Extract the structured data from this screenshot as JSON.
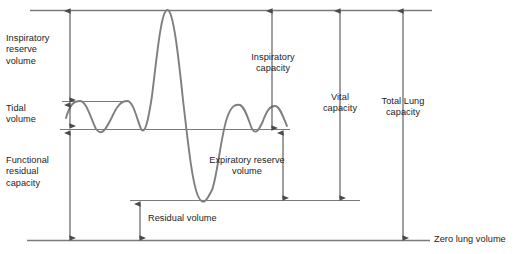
{
  "figure": {
    "stroke_color": "#7b7b7b",
    "arrow_color": "#4a4a4a",
    "text_color": "#1c1c1c",
    "background": "#ffffff"
  },
  "labels": {
    "inspiratory_reserve_volume": "Inspiratory\nreserve\nvolume",
    "tidal_volume": "Tidal\nvolume",
    "functional_residual_capacity": "Functional\nresidual\ncapacity",
    "residual_volume": "Residual volume",
    "expiratory_reserve_volume": "Expiratory reserve\nvolume",
    "inspiratory_capacity": "Inspiratory\ncapacity",
    "vital_capacity": "Vital\ncapacity",
    "total_lung_capacity": "Total Lung\ncapacity",
    "zero_lung_volume": "Zero lung volume"
  },
  "chart_data": {
    "type": "line",
    "xlabel": "",
    "ylabel": "Lung volume",
    "grid": false,
    "legend": null,
    "reference_levels": [
      {
        "name": "maximum-inspiration-level",
        "label": "Maximal inspiratory level",
        "y_px": 10,
        "x_start_px": 30,
        "x_end_px": 432
      },
      {
        "name": "tidal-peak-level",
        "label": "Tidal inspiratory level",
        "y_px": 101,
        "x_start_px": 62,
        "x_end_px": 130
      },
      {
        "name": "end-expiratory-level",
        "label": "End-expiratory (FRC) level",
        "y_px": 129,
        "x_start_px": 60,
        "x_end_px": 290
      },
      {
        "name": "residual-volume-level",
        "label": "Maximal expiratory level",
        "y_px": 200,
        "x_start_px": 130,
        "x_end_px": 360
      },
      {
        "name": "zero-lung-volume-level",
        "label": "Zero lung volume",
        "y_px": 240,
        "x_start_px": 27,
        "x_end_px": 430
      }
    ],
    "measures": [
      {
        "name": "inspiratory-reserve-volume",
        "label": "Inspiratory reserve volume",
        "from_level": "tidal-peak-level",
        "to_level": "maximum-inspiration-level",
        "arrow_x_px": 70,
        "y_top_px": 10,
        "y_bottom_px": 100,
        "double_headed": true
      },
      {
        "name": "tidal-volume",
        "label": "Tidal volume",
        "from_level": "end-expiratory-level",
        "to_level": "tidal-peak-level",
        "arrow_x_px": 70,
        "y_top_px": 104,
        "y_bottom_px": 126,
        "double_headed": true
      },
      {
        "name": "functional-residual-capacity",
        "label": "Functional residual capacity",
        "from_level": "zero-lung-volume-level",
        "to_level": "end-expiratory-level",
        "arrow_x_px": 70,
        "y_top_px": 132,
        "y_bottom_px": 238,
        "double_headed": true
      },
      {
        "name": "residual-volume",
        "label": "Residual volume",
        "from_level": "zero-lung-volume-level",
        "to_level": "residual-volume-level",
        "arrow_x_px": 140,
        "y_top_px": 203,
        "y_bottom_px": 238,
        "double_headed": true
      },
      {
        "name": "expiratory-reserve-volume",
        "label": "Expiratory reserve volume",
        "from_level": "residual-volume-level",
        "to_level": "end-expiratory-level",
        "arrow_x_px": 283,
        "y_top_px": 132,
        "y_bottom_px": 198,
        "double_headed": true
      },
      {
        "name": "inspiratory-capacity",
        "label": "Inspiratory capacity",
        "from_level": "end-expiratory-level",
        "to_level": "maximum-inspiration-level",
        "arrow_x_px": 272,
        "y_top_px": 10,
        "y_bottom_px": 128,
        "double_headed": true
      },
      {
        "name": "vital-capacity",
        "label": "Vital capacity",
        "from_level": "residual-volume-level",
        "to_level": "maximum-inspiration-level",
        "arrow_x_px": 340,
        "y_top_px": 10,
        "y_bottom_px": 198,
        "double_headed": true
      },
      {
        "name": "total-lung-capacity",
        "label": "Total lung capacity",
        "from_level": "zero-lung-volume-level",
        "to_level": "maximum-inspiration-level",
        "arrow_x_px": 403,
        "y_top_px": 10,
        "y_bottom_px": 238,
        "double_headed": true
      }
    ],
    "trace_description": "Spirogram trace: three quiet tidal breaths, a maximal inspiration to total lung capacity, a maximal expiration to residual volume, then two quiet tidal breaths",
    "trace_path_px": "M 66,118 C 70,104 74,101 80,101 C 86,101 90,116 96,129 C 102,137 106,129 112,117 C 117,106 121,101 127,101 C 133,101 136,116 141,129 C 145,135 148,122 152,96 C 157,55 161,12 167,10 C 173,8 178,52 183,100 C 188,143 192,182 198,196 C 203,207 207,200 212,190 C 217,178 221,135 227,118 C 231,106 235,104 240,105 C 245,107 248,119 252,129 C 256,135 259,130 263,121 C 267,110 270,106 275,106 C 280,106 283,117 287,126"
  }
}
